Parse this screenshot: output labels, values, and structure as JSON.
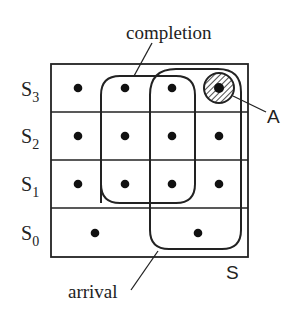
{
  "diagram": {
    "set_label": "S",
    "rows": [
      {
        "label": "S",
        "sub": "3",
        "dots_x": [
          78,
          125,
          172,
          219
        ]
      },
      {
        "label": "S",
        "sub": "2",
        "dots_x": [
          78,
          125,
          172,
          219
        ]
      },
      {
        "label": "S",
        "sub": "1",
        "dots_x": [
          78,
          125,
          172,
          219
        ]
      },
      {
        "label": "S",
        "sub": "0",
        "dots_x": [
          95,
          198
        ]
      }
    ],
    "regions": [
      {
        "name": "completion",
        "label": "completion"
      },
      {
        "name": "arrival",
        "label": "arrival"
      }
    ],
    "highlight": {
      "label": "A",
      "description": "hatched circle around top-right state in S3"
    },
    "colors": {
      "stroke": "#222222",
      "dot": "#111111",
      "background": "#ffffff"
    }
  }
}
